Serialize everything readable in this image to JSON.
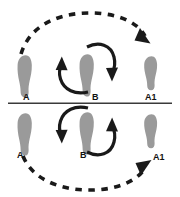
{
  "figure": {
    "background_color": "#ffffff",
    "footprint_color": "#9a9a9a",
    "line_color": "#1a1a1a",
    "divider_color": "#3a3a3a"
  },
  "labels": {
    "top_left": "A",
    "top_center": "B",
    "top_right": "A1",
    "bottom_left": "A",
    "bottom_center": "B",
    "bottom_right": "A1",
    "bottom_right_arrow": "A1"
  },
  "panels": [
    {
      "name": "top-panel",
      "footprints": [
        {
          "id": "A",
          "label": "A",
          "position": "left",
          "orientation": "upright-long"
        },
        {
          "id": "B",
          "label": "B",
          "position": "center",
          "orientation": "upright-long"
        },
        {
          "id": "A1",
          "label": "A1",
          "position": "right",
          "orientation": "upright-short"
        }
      ],
      "dashed_arc": {
        "from": "A",
        "to": "A1",
        "direction": "clockwise-over-top",
        "arrow_at": "A1"
      },
      "solid_arcs": [
        {
          "name": "right-arc",
          "direction": "clockwise",
          "arrow_direction": "down"
        },
        {
          "name": "left-arc",
          "direction": "counter-clockwise",
          "arrow_direction": "up"
        }
      ]
    },
    {
      "name": "bottom-panel",
      "footprints": [
        {
          "id": "A",
          "label": "A",
          "position": "left",
          "orientation": "upright-long"
        },
        {
          "id": "B",
          "label": "B",
          "position": "center",
          "orientation": "upright-long"
        },
        {
          "id": "A1",
          "label": "A1",
          "position": "right",
          "orientation": "upright-short"
        }
      ],
      "dashed_arc": {
        "from": "A",
        "to": "A1",
        "direction": "counter-clockwise-under-bottom",
        "arrow_at": "A1"
      },
      "solid_arcs": [
        {
          "name": "left-arc",
          "direction": "clockwise",
          "arrow_direction": "down"
        },
        {
          "name": "right-arc",
          "direction": "counter-clockwise",
          "arrow_direction": "up"
        }
      ]
    }
  ]
}
